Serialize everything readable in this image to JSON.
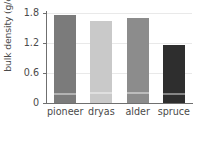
{
  "chart_data": {
    "type": "bar",
    "title": "",
    "xlabel": "",
    "ylabel": "bulk density (g/cm",
    "ylabel_exponent": "3",
    "ylabel_suffix": ")",
    "categories": [
      "pioneer",
      "dryas",
      "alder",
      "spruce"
    ],
    "values": [
      1.77,
      1.65,
      1.71,
      1.17
    ],
    "lower_segment_values": [
      0.16,
      0.18,
      0.19,
      0.17
    ],
    "series": [
      {
        "name": "bulk density",
        "values": [
          1.77,
          1.65,
          1.71,
          1.17
        ]
      }
    ],
    "ylim": [
      0,
      1.85
    ],
    "yticks": [
      0,
      0.6,
      1.2,
      1.8
    ],
    "ytick_labels": [
      "0",
      "0.6",
      "1.2",
      "1.8"
    ],
    "grid": true,
    "legend": "none",
    "bar_colors": [
      "#7b7b7b",
      "#c9c9c9",
      "#8c8c8c",
      "#2e2e2e"
    ],
    "grid_color": "#e9e9e9",
    "axis_color": "#6f6f6f",
    "text_color": "#4a4a4a"
  }
}
